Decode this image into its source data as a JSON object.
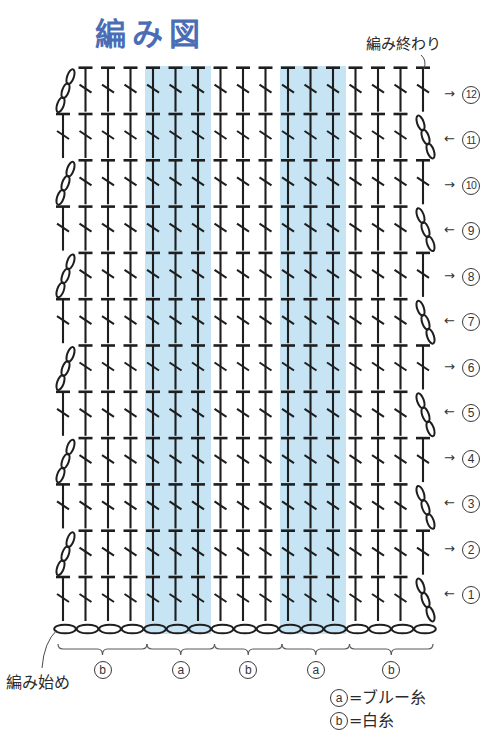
{
  "title": "編み図",
  "annotations": {
    "end_label": "編み終わり",
    "start_label": "編み始め"
  },
  "colors": {
    "title": "#4a6db5",
    "blue_yarn_band": "#c6e4f4",
    "stitch_line": "#1e1e1e"
  },
  "chart_data": {
    "type": "diagram",
    "title": "編み図",
    "symbols": {
      "stitch": "double-crochet-symbol",
      "turning_chain": "chain-3-symbol",
      "foundation": "chain-symbol"
    },
    "columns": 17,
    "stitches_per_row": 16,
    "foundation_chains": 17,
    "sections": [
      {
        "key": "b",
        "stitches": 4
      },
      {
        "key": "a",
        "stitches": 3
      },
      {
        "key": "b",
        "stitches": 3
      },
      {
        "key": "a",
        "stitches": 3
      },
      {
        "key": "b",
        "stitches": 4
      }
    ],
    "rows": [
      {
        "number": 1,
        "arrow": "←",
        "turning_chain": "right"
      },
      {
        "number": 2,
        "arrow": "→",
        "turning_chain": "left"
      },
      {
        "number": 3,
        "arrow": "←",
        "turning_chain": "right"
      },
      {
        "number": 4,
        "arrow": "→",
        "turning_chain": "left"
      },
      {
        "number": 5,
        "arrow": "←",
        "turning_chain": "right"
      },
      {
        "number": 6,
        "arrow": "→",
        "turning_chain": "left"
      },
      {
        "number": 7,
        "arrow": "←",
        "turning_chain": "right"
      },
      {
        "number": 8,
        "arrow": "→",
        "turning_chain": "left"
      },
      {
        "number": 9,
        "arrow": "←",
        "turning_chain": "right"
      },
      {
        "number": 10,
        "arrow": "→",
        "turning_chain": "left"
      },
      {
        "number": 11,
        "arrow": "←",
        "turning_chain": "right"
      },
      {
        "number": 12,
        "arrow": "→",
        "turning_chain": "left"
      }
    ],
    "legend": [
      {
        "key": "a",
        "text": "=ブルー糸",
        "color": "#c6e4f4"
      },
      {
        "key": "b",
        "text": "=白糸",
        "color": "#ffffff"
      }
    ]
  }
}
